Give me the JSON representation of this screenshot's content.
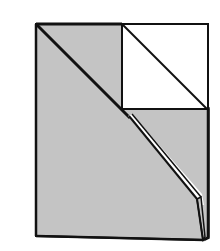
{
  "diagram": {
    "colors": {
      "background": "#ffffff",
      "paper_shaded": "#c4c4c4",
      "paper_white": "#ffffff",
      "stroke": "#111111"
    },
    "elements": [
      {
        "name": "shaded-sheet",
        "description": "Gray shaded paper rectangle"
      },
      {
        "name": "white-square-flap",
        "description": "White square in upper right"
      },
      {
        "name": "square-diagonal",
        "description": "Diagonal crease in white square"
      },
      {
        "name": "main-diagonal-fold",
        "description": "Thick diagonal fold line from top-left to bottom-right"
      },
      {
        "name": "folded-edge-tab",
        "description": "Folded edge tab at lower right"
      }
    ]
  }
}
